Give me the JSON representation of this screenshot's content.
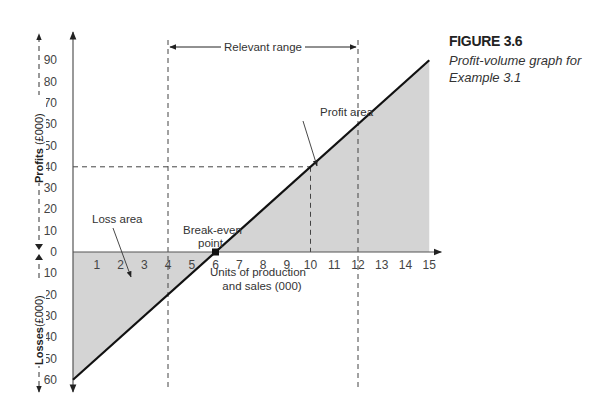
{
  "figure": {
    "label": "FIGURE 3.6",
    "caption": "Profit-volume graph for Example 3.1"
  },
  "chart_data": {
    "type": "line",
    "title": "Profit-volume graph for Example 3.1",
    "xlabel": "Units of production and sales (000)",
    "ylabel_positive": "Profits (£000)",
    "ylabel_negative": "Losses (£000)",
    "x_ticks": [
      1,
      2,
      3,
      4,
      5,
      6,
      7,
      8,
      9,
      10,
      11,
      12,
      13,
      14,
      15
    ],
    "y_ticks_profit": [
      10,
      20,
      30,
      40,
      50,
      60,
      70,
      80,
      90
    ],
    "y_ticks_loss": [
      10,
      20,
      30,
      40,
      50,
      60
    ],
    "zero_label": "0",
    "xlim": [
      0,
      15
    ],
    "ylim": [
      -60,
      90
    ],
    "series": [
      {
        "name": "Profit/loss",
        "x": [
          0,
          6,
          10,
          15
        ],
        "y": [
          -60,
          0,
          40,
          90
        ]
      }
    ],
    "break_even": {
      "x": 6,
      "y": 0,
      "label": "Break-even point"
    },
    "relevant_range": {
      "x_start": 4,
      "x_end": 12,
      "label": "Relevant range"
    },
    "reference_point": {
      "x": 10,
      "y": 40
    },
    "annotations": [
      {
        "text": "Profit area"
      },
      {
        "text": "Loss area"
      },
      {
        "text": "Break-even point"
      },
      {
        "text": "Relevant range"
      }
    ],
    "colors": {
      "shade": "#d4d4d4",
      "line": "#111111",
      "axis": "#555555"
    },
    "grid": false,
    "legend": "none"
  }
}
